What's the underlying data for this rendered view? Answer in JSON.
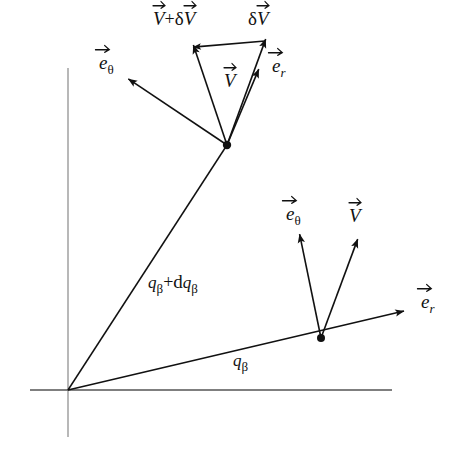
{
  "figure": {
    "type": "vector-diagram",
    "background_color": "#ffffff",
    "ink_color": "#111111",
    "axis_color": "#9a9a9a",
    "width": 465,
    "height": 449
  },
  "axes": {
    "origin": {
      "x": 68,
      "y": 390
    },
    "vertical": {
      "x": 68,
      "y_top": 68,
      "y_bottom": 437,
      "color": "#9a9a9a"
    },
    "horizontal": {
      "y": 390,
      "x_left": 30,
      "x_right": 392,
      "color": "#555555"
    }
  },
  "points": {
    "upper": {
      "x": 227,
      "y": 145,
      "name": "upper-position-point"
    },
    "lower": {
      "x": 321,
      "y": 338,
      "name": "lower-position-point"
    }
  },
  "rays": [
    {
      "name": "ray-q-beta-plus-dq-beta",
      "from": "origin",
      "to_x": 227,
      "to_y": 145
    },
    {
      "name": "ray-q-beta",
      "from": "origin",
      "to_x": 404,
      "to_y": 311,
      "arrow": true
    }
  ],
  "labels": {
    "angle_upper": {
      "text": "q",
      "sub": "β",
      "op": "+d",
      "text2": "q",
      "sub2": "β",
      "x": 148,
      "y": 272
    },
    "angle_lower": {
      "text": "q",
      "sub": "β",
      "x": 233,
      "y": 352
    },
    "v_plus_delta_v": {
      "text": "V+δV",
      "x": 153,
      "y": 8
    },
    "delta_v": {
      "text": "δV",
      "x": 248,
      "y": 8
    },
    "v_upper": {
      "text": "V",
      "x": 224,
      "y": 70
    },
    "e_theta_upper": {
      "text": "e",
      "sub": "θ",
      "x": 99,
      "y": 52
    },
    "e_r_upper": {
      "text": "e",
      "sub": "r",
      "x": 272,
      "y": 55
    },
    "e_theta_lower": {
      "text": "e",
      "sub": "θ",
      "x": 286,
      "y": 203
    },
    "v_lower": {
      "text": "V",
      "x": 349,
      "y": 205
    },
    "e_r_lower": {
      "text": "e",
      "sub": "r",
      "x": 421,
      "y": 291
    }
  },
  "vectors": [
    {
      "name": "e-theta-upper-arrow",
      "x1": 227,
      "y1": 145,
      "x2": 130,
      "y2": 80
    },
    {
      "name": "v-plus-delta-v-arrow",
      "x1": 227,
      "y1": 145,
      "x2": 194,
      "y2": 47
    },
    {
      "name": "v-upper-arrow",
      "x1": 227,
      "y1": 145,
      "x2": 265,
      "y2": 41
    },
    {
      "name": "e-r-upper-arrow",
      "x1": 227,
      "y1": 145,
      "x2": 258,
      "y2": 71
    },
    {
      "name": "delta-v-arrow",
      "x1": 265,
      "y1": 41,
      "x2": 195,
      "y2": 47
    },
    {
      "name": "e-theta-lower-arrow",
      "x1": 321,
      "y1": 338,
      "x2": 300,
      "y2": 236
    },
    {
      "name": "v-lower-arrow",
      "x1": 321,
      "y1": 338,
      "x2": 357,
      "y2": 241
    }
  ]
}
